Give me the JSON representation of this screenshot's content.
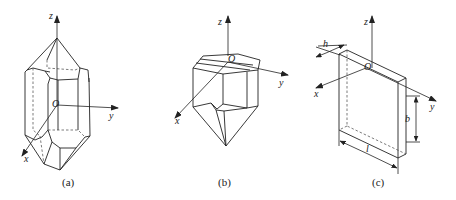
{
  "figure": {
    "panels": [
      {
        "id": "a",
        "caption": "(a)",
        "axes": {
          "z": "z",
          "y": "y",
          "x": "x",
          "origin": "O"
        },
        "description": "Doubly-terminated hexagonal quartz crystal"
      },
      {
        "id": "b",
        "caption": "(b)",
        "axes": {
          "z": "z",
          "y": "y",
          "x": "x",
          "origin": "O"
        },
        "description": "Singly-terminated crystal with cut top"
      },
      {
        "id": "c",
        "caption": "(c)",
        "axes": {
          "z": "z",
          "y": "y",
          "x": "x",
          "origin": "O"
        },
        "dimensions": {
          "thickness": "h",
          "length": "l",
          "width": "b"
        },
        "description": "Rectangular crystal plate cut"
      }
    ]
  },
  "colors": {
    "line": "#222222",
    "background": "#ffffff"
  }
}
